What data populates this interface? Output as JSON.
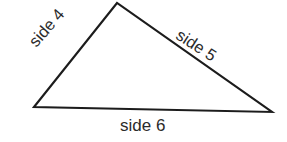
{
  "figure": {
    "name": "labeled-triangle-diagram",
    "type": "geometry-diagram",
    "background_color": "#ffffff",
    "stroke_color": "#1c1c1c",
    "stroke_width": 2.1,
    "text_color": "#2b2b2b",
    "width": 287,
    "height": 142,
    "shape": {
      "kind": "triangle",
      "vertices": {
        "left": {
          "x": 34,
          "y": 107
        },
        "apex": {
          "x": 117,
          "y": 3
        },
        "right": {
          "x": 272,
          "y": 112
        }
      },
      "points_path": "34,107 117,3 272,112"
    },
    "labels": {
      "left_edge": {
        "text": "side 4",
        "rotation_deg": -49,
        "value": 4
      },
      "right_edge": {
        "text": "side 5",
        "rotation_deg": 33,
        "value": 5
      },
      "bottom_edge": {
        "text": "side 6",
        "rotation_deg": 0,
        "value": 6
      }
    }
  }
}
